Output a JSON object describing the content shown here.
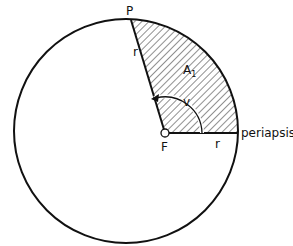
{
  "diagram": {
    "labels": {
      "point_p": "P",
      "focus": "F",
      "radius_upper": "r",
      "radius_lower": "r",
      "area": "A",
      "area_subscript": "1",
      "angle": "v",
      "periapsis": "periapsis"
    },
    "colors": {
      "stroke": "#111111",
      "background": "#ffffff"
    }
  }
}
